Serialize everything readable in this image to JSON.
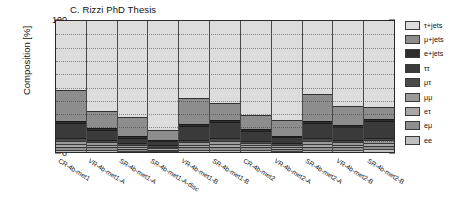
{
  "chart_data": {
    "type": "bar",
    "stacked": true,
    "title": "C. Rizzi PhD Thesis",
    "xlabel": "",
    "ylabel": "Composition [%]",
    "ylim": [
      0,
      100
    ],
    "ytick_labels": [
      "0",
      "10",
      "20",
      "30",
      "40",
      "50",
      "60",
      "70",
      "80",
      "90",
      "100"
    ],
    "ytick_values": [
      0,
      10,
      20,
      30,
      40,
      50,
      60,
      70,
      80,
      90,
      100
    ],
    "grid": true,
    "grid_axis": "y",
    "legend_position": "right",
    "categories": [
      "CR-4b-met1",
      "VR-4b-met1-A",
      "SR-4b-met1-A",
      "SR-4b-met1-A-disc",
      "VR-4b-met1-B",
      "SR-4b-met1-B",
      "CR-4b-met2",
      "VR-4b-met2-A",
      "SR-4b-met2-A",
      "VR-4b-met2-B",
      "SR-4b-met2-B"
    ],
    "series": [
      {
        "name": "ee",
        "color": "#bfbfbf",
        "values": [
          1.5,
          1.5,
          1.0,
          0.8,
          1.5,
          1.5,
          1.5,
          1.0,
          1.5,
          1.5,
          2.0
        ]
      },
      {
        "name": "eμ",
        "color": "#8f8f8f",
        "values": [
          2.5,
          2.0,
          1.5,
          1.0,
          2.0,
          2.5,
          2.0,
          1.5,
          2.5,
          2.0,
          2.5
        ]
      },
      {
        "name": "eτ",
        "color": "#a8a8a8",
        "values": [
          2.0,
          2.0,
          1.5,
          1.0,
          2.0,
          2.0,
          1.5,
          1.5,
          2.0,
          2.0,
          2.0
        ]
      },
      {
        "name": "μμ",
        "color": "#9a9a9a",
        "values": [
          2.5,
          2.0,
          1.5,
          1.0,
          2.0,
          2.5,
          2.0,
          1.5,
          2.5,
          2.0,
          2.5
        ]
      },
      {
        "name": "μτ",
        "color": "#4a4a4a",
        "values": [
          2.0,
          2.0,
          1.5,
          1.2,
          2.0,
          2.0,
          1.5,
          1.5,
          2.0,
          2.0,
          2.0
        ]
      },
      {
        "name": "ττ",
        "color": "#3a3a3a",
        "values": [
          11.5,
          7.5,
          4.0,
          3.0,
          10.5,
          12.5,
          7.5,
          4.5,
          12.0,
          9.5,
          13.0
        ]
      },
      {
        "name": "e+jets",
        "color": "#2e2e2e",
        "values": [
          1.5,
          1.5,
          1.0,
          1.0,
          1.5,
          1.5,
          1.5,
          1.0,
          1.5,
          1.5,
          1.5
        ]
      },
      {
        "name": "μ+jets",
        "color": "#8d8d8d",
        "values": [
          23.5,
          12.5,
          15.0,
          7.5,
          19.5,
          13.0,
          11.0,
          12.0,
          20.5,
          14.5,
          9.0
        ]
      },
      {
        "name": "τ+jets",
        "color": "#dcdcdc",
        "values": [
          53.0,
          69.0,
          73.0,
          83.5,
          59.0,
          62.5,
          71.5,
          75.5,
          55.5,
          65.0,
          65.5
        ]
      }
    ],
    "legend_order": [
      "τ+jets",
      "μ+jets",
      "e+jets",
      "ττ",
      "μτ",
      "μμ",
      "eτ",
      "eμ",
      "ee"
    ],
    "legend_colors": [
      "#dcdcdc",
      "#8d8d8d",
      "#2e2e2e",
      "#3a3a3a",
      "#4a4a4a",
      "#9a9a9a",
      "#a8a8a8",
      "#8f8f8f",
      "#bfbfbf"
    ]
  }
}
